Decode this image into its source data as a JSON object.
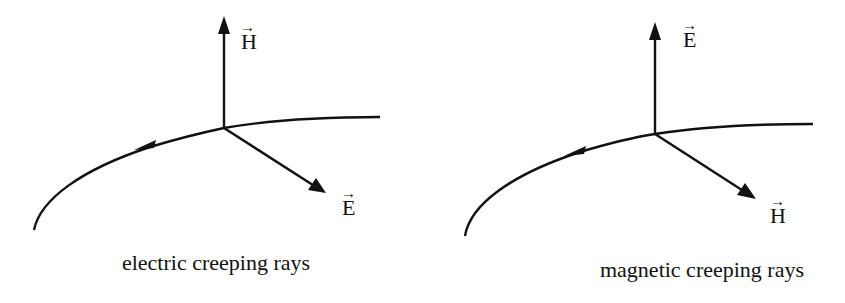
{
  "panels": [
    {
      "caption": "electric creeping rays",
      "vertical_vector": "H",
      "tangent_vector": "E"
    },
    {
      "caption": "magnetic creeping rays",
      "vertical_vector": "E",
      "tangent_vector": "H"
    }
  ],
  "vector_arrow_symbol": "→"
}
